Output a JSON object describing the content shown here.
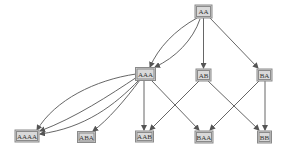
{
  "diagram": {
    "type": "directed-graph",
    "colors": {
      "node_fill": "#d9d9d9",
      "node_border": "#8a8a8a",
      "node_text": "#333333",
      "edge": "#555555",
      "background": "#ffffff"
    },
    "nodes": [
      {
        "id": "AA",
        "label": "AA",
        "x": 203.5,
        "y": 11.5,
        "w": 17,
        "h": 13
      },
      {
        "id": "AAA",
        "label": "AAA",
        "x": 145.5,
        "y": 74,
        "w": 20,
        "h": 13
      },
      {
        "id": "AB",
        "label": "AB",
        "x": 203.5,
        "y": 75,
        "w": 15,
        "h": 12
      },
      {
        "id": "BA",
        "label": "BA",
        "x": 264.5,
        "y": 75,
        "w": 15,
        "h": 12
      },
      {
        "id": "AAAA",
        "label": "AAAA",
        "x": 27,
        "y": 136,
        "w": 24,
        "h": 12
      },
      {
        "id": "ABA",
        "label": "ABA",
        "x": 86.5,
        "y": 137,
        "w": 18,
        "h": 11
      },
      {
        "id": "AAB",
        "label": "AAB",
        "x": 144.5,
        "y": 136.5,
        "w": 18,
        "h": 11
      },
      {
        "id": "BAA",
        "label": "BAA",
        "x": 204,
        "y": 137,
        "w": 18,
        "h": 12
      },
      {
        "id": "BB",
        "label": "BB",
        "x": 264.5,
        "y": 137,
        "w": 14,
        "h": 12
      }
    ],
    "edges": [
      {
        "from": "AA",
        "to": "AAA",
        "path": "M197,18 C175,30 158,48 150,67"
      },
      {
        "from": "AA",
        "to": "AAA",
        "path": "M200,19 C193,40 175,58 155,67"
      },
      {
        "from": "AA",
        "to": "AB",
        "path": "M203.5,18 L203.5,68"
      },
      {
        "from": "AA",
        "to": "BA",
        "path": "M210,18 L258,68"
      },
      {
        "from": "AAA",
        "to": "AAAA",
        "path": "M136,74 C95,80 55,100 37,130"
      },
      {
        "from": "AAA",
        "to": "AAAA",
        "path": "M137,77 C110,95 75,118 40,131"
      },
      {
        "from": "AAA",
        "to": "AAAA",
        "path": "M139,80 C115,105 85,128 40,134"
      },
      {
        "from": "AAA",
        "to": "ABA",
        "path": "M140,80 C125,100 108,120 93,131"
      },
      {
        "from": "AAA",
        "to": "AAB",
        "path": "M144,81 L144,130"
      },
      {
        "from": "AAA",
        "to": "BAA",
        "path": "M152,81 L199,130"
      },
      {
        "from": "AB",
        "to": "AAB",
        "path": "M199,81 L150,130"
      },
      {
        "from": "AB",
        "to": "BB",
        "path": "M208,81 L259,130"
      },
      {
        "from": "BA",
        "to": "BAA",
        "path": "M259,81 L210,130"
      },
      {
        "from": "BA",
        "to": "BB",
        "path": "M265,81 L265,130"
      }
    ]
  }
}
